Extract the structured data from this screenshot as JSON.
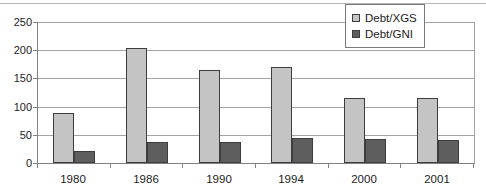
{
  "chart_data": {
    "type": "bar",
    "title": "",
    "xlabel": "",
    "ylabel": "",
    "categories": [
      "1980",
      "1986",
      "1990",
      "1994",
      "2000",
      "2001"
    ],
    "series": [
      {
        "name": "Debt/XGS",
        "color": "#c4c4c4",
        "values": [
          88,
          204,
          165,
          170,
          116,
          116
        ]
      },
      {
        "name": "Debt/GNI",
        "color": "#5e5e5e",
        "values": [
          22,
          38,
          37,
          44,
          42,
          41
        ]
      }
    ],
    "ylim": [
      0,
      250
    ],
    "yticks": [
      0,
      50,
      100,
      150,
      200,
      250
    ],
    "grid": true,
    "legend_position": "top-right"
  },
  "colors": {
    "background": "#ffffff",
    "top_border": "#b5b5b5",
    "gridline": "#a3a3a3",
    "axis": "#808080",
    "bar_border": "#3d3d3d",
    "legend_border": "#7a7a7a",
    "text": "#1c1c1c"
  }
}
